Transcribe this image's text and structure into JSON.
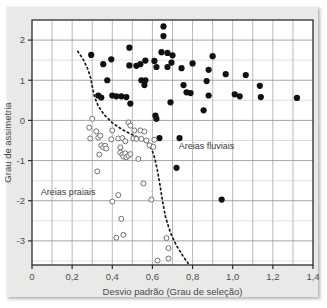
{
  "chart_data": {
    "type": "scatter",
    "title": "",
    "xlabel": "Desvio padrão (Grau de seleção)",
    "ylabel": "Grau de assimetria",
    "xlim": [
      0,
      1.4
    ],
    "ylim": [
      -3.6,
      2.5
    ],
    "xticks": [
      0,
      0.2,
      0.4,
      0.6,
      0.8,
      1.0,
      1.2,
      1.4
    ],
    "xtick_labels": [
      "0",
      "0,2",
      "0,4",
      "0,6",
      "0,8",
      "1,0",
      "1,2",
      "1,4"
    ],
    "yticks": [
      2,
      1,
      0,
      -1,
      -2,
      -3
    ],
    "ytick_labels": [
      "2",
      "1",
      "0",
      "-1",
      "-2",
      "-3"
    ],
    "grid": true,
    "grid_x_step": 0.1,
    "grid_y_step": 0.5,
    "legend_position": "none",
    "annotations": [
      {
        "text": "Areias fluviais",
        "x": 0.87,
        "y": -0.72
      },
      {
        "text": "Areias praiais",
        "x": 0.18,
        "y": -1.85
      }
    ],
    "series": [
      {
        "name": "Areias fluviais",
        "marker": "filled-circle",
        "color": "#111111",
        "points": [
          [
            0.655,
            2.34
          ],
          [
            0.655,
            2.1
          ],
          [
            0.485,
            1.81
          ],
          [
            0.295,
            1.63
          ],
          [
            0.645,
            1.7
          ],
          [
            0.675,
            1.68
          ],
          [
            0.7,
            1.62
          ],
          [
            0.9,
            1.6
          ],
          [
            0.395,
            1.52
          ],
          [
            0.565,
            1.49
          ],
          [
            0.61,
            1.48
          ],
          [
            0.695,
            1.44
          ],
          [
            0.355,
            1.4
          ],
          [
            0.485,
            1.37
          ],
          [
            0.52,
            1.36
          ],
          [
            0.54,
            1.4
          ],
          [
            0.62,
            1.33
          ],
          [
            0.675,
            1.33
          ],
          [
            0.745,
            1.3
          ],
          [
            0.8,
            1.42
          ],
          [
            0.88,
            1.26
          ],
          [
            0.965,
            1.15
          ],
          [
            1.065,
            1.13
          ],
          [
            0.375,
            1.0
          ],
          [
            0.545,
            1.0
          ],
          [
            0.565,
            1.0
          ],
          [
            0.56,
            0.88
          ],
          [
            0.87,
            0.98
          ],
          [
            0.755,
            0.88
          ],
          [
            1.135,
            0.86
          ],
          [
            0.33,
            0.62
          ],
          [
            0.345,
            0.57
          ],
          [
            0.4,
            0.62
          ],
          [
            0.42,
            0.6
          ],
          [
            0.445,
            0.6
          ],
          [
            0.47,
            0.58
          ],
          [
            0.77,
            0.7
          ],
          [
            0.79,
            0.68
          ],
          [
            0.88,
            0.62
          ],
          [
            1.01,
            0.65
          ],
          [
            1.035,
            0.6
          ],
          [
            1.14,
            0.58
          ],
          [
            1.32,
            0.56
          ],
          [
            0.49,
            0.42
          ],
          [
            0.69,
            0.45
          ],
          [
            0.855,
            0.25
          ],
          [
            0.615,
            0.12
          ],
          [
            0.62,
            0.04
          ],
          [
            0.635,
            -0.44
          ],
          [
            0.735,
            -0.44
          ],
          [
            0.72,
            -1.18
          ],
          [
            0.945,
            -1.97
          ]
        ]
      },
      {
        "name": "Areias praiais",
        "marker": "open-circle",
        "color": "#6f6f6f",
        "points": [
          [
            0.3,
            0.04
          ],
          [
            0.285,
            -0.18
          ],
          [
            0.32,
            -0.27
          ],
          [
            0.4,
            -0.25
          ],
          [
            0.48,
            -0.05
          ],
          [
            0.49,
            -0.13
          ],
          [
            0.51,
            -0.25
          ],
          [
            0.54,
            -0.25
          ],
          [
            0.56,
            -0.28
          ],
          [
            0.29,
            -0.45
          ],
          [
            0.33,
            -0.43
          ],
          [
            0.34,
            -0.38
          ],
          [
            0.395,
            -0.47
          ],
          [
            0.43,
            -0.45
          ],
          [
            0.45,
            -0.44
          ],
          [
            0.465,
            -0.52
          ],
          [
            0.505,
            -0.45
          ],
          [
            0.52,
            -0.46
          ],
          [
            0.545,
            -0.46
          ],
          [
            0.57,
            -0.5
          ],
          [
            0.61,
            -0.48
          ],
          [
            0.345,
            -0.62
          ],
          [
            0.355,
            -0.67
          ],
          [
            0.365,
            -0.63
          ],
          [
            0.37,
            -0.7
          ],
          [
            0.44,
            -0.67
          ],
          [
            0.585,
            -0.62
          ],
          [
            0.605,
            -0.66
          ],
          [
            0.335,
            -0.85
          ],
          [
            0.44,
            -0.8
          ],
          [
            0.45,
            -0.85
          ],
          [
            0.455,
            -0.9
          ],
          [
            0.465,
            -0.82
          ],
          [
            0.47,
            -0.92
          ],
          [
            0.48,
            -0.88
          ],
          [
            0.49,
            -0.84
          ],
          [
            0.325,
            -1.27
          ],
          [
            0.53,
            -0.96
          ],
          [
            0.555,
            -1.57
          ],
          [
            0.43,
            -1.86
          ],
          [
            0.595,
            -1.97
          ],
          [
            0.4,
            -2.02
          ],
          [
            0.445,
            -2.45
          ],
          [
            0.42,
            -2.92
          ],
          [
            0.455,
            -2.85
          ],
          [
            0.67,
            -2.93
          ],
          [
            0.68,
            -3.18
          ],
          [
            0.625,
            -3.49
          ],
          [
            0.68,
            -3.44
          ]
        ]
      }
    ],
    "boundary_curve": {
      "name": "boundary-dashed-curve",
      "style": "dotted",
      "color": "#1a1a1a",
      "points": [
        [
          0.228,
          1.72
        ],
        [
          0.255,
          1.52
        ],
        [
          0.278,
          1.28
        ],
        [
          0.293,
          1.04
        ],
        [
          0.302,
          0.8
        ],
        [
          0.312,
          0.58
        ],
        [
          0.33,
          0.36
        ],
        [
          0.36,
          0.14
        ],
        [
          0.4,
          -0.06
        ],
        [
          0.45,
          -0.23
        ],
        [
          0.505,
          -0.37
        ],
        [
          0.545,
          -0.45
        ],
        [
          0.575,
          -0.56
        ],
        [
          0.597,
          -0.72
        ],
        [
          0.612,
          -0.95
        ],
        [
          0.625,
          -1.25
        ],
        [
          0.638,
          -1.62
        ],
        [
          0.65,
          -2.0
        ],
        [
          0.665,
          -2.4
        ],
        [
          0.69,
          -2.8
        ],
        [
          0.72,
          -3.12
        ],
        [
          0.755,
          -3.4
        ],
        [
          0.778,
          -3.56
        ]
      ]
    }
  }
}
